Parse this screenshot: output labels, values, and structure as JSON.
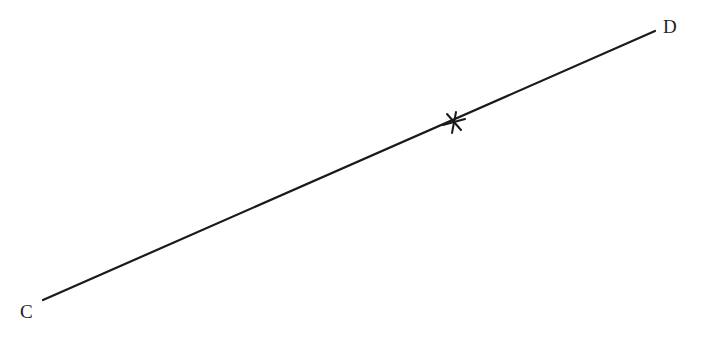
{
  "diagram": {
    "segment": {
      "name": "CD",
      "start": {
        "label": "C",
        "x": 43,
        "y": 300
      },
      "end": {
        "label": "D",
        "x": 655,
        "y": 31
      },
      "stroke_color": "#1a1a1a",
      "stroke_width": 2.2
    },
    "mark": {
      "type": "cross",
      "x": 454,
      "y": 122,
      "color": "#1a1a1a"
    },
    "labels": [
      {
        "text": "C",
        "x": 20,
        "y": 318
      },
      {
        "text": "D",
        "x": 663,
        "y": 33
      }
    ]
  }
}
